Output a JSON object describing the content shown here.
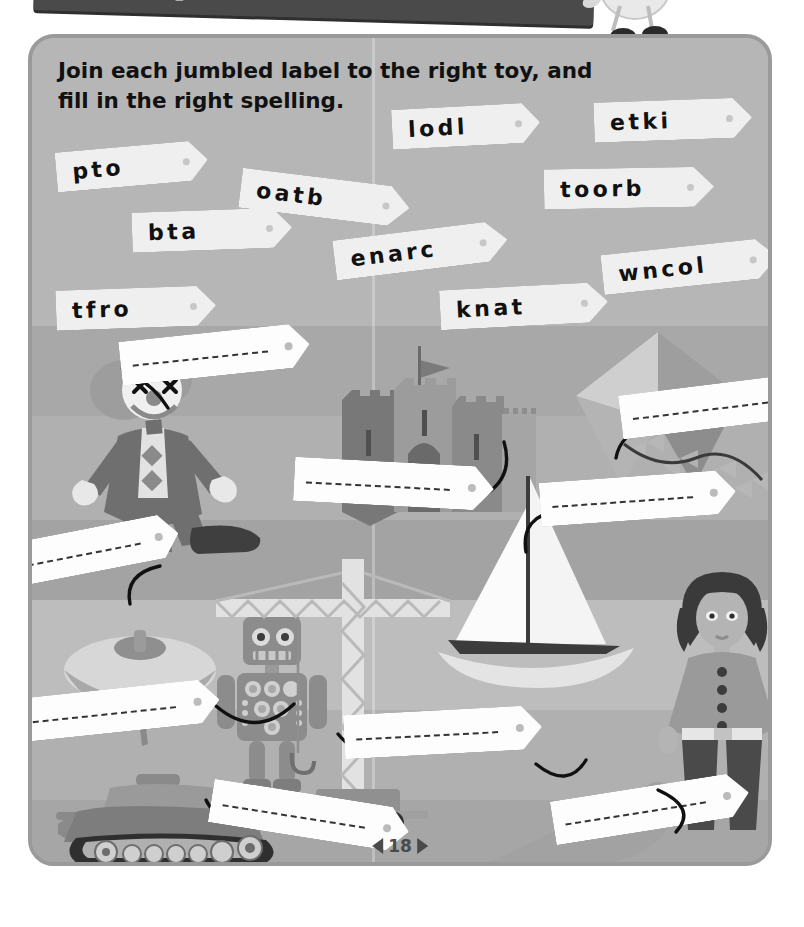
{
  "header": {
    "banner_text": "IN TH",
    "mascot_letter": "c"
  },
  "instruction": "Join each jumbled label to the right toy, and fill in the right spelling.",
  "jumbled_labels": [
    {
      "text": "pto",
      "answer": "top"
    },
    {
      "text": "oatb",
      "answer": "boat"
    },
    {
      "text": "lodl",
      "answer": "doll"
    },
    {
      "text": "etki",
      "answer": "kite"
    },
    {
      "text": "bta",
      "answer": "bat"
    },
    {
      "text": "toorb",
      "answer": "robot"
    },
    {
      "text": "enarc",
      "answer": "crane"
    },
    {
      "text": "wncol",
      "answer": "clown"
    },
    {
      "text": "tfro",
      "answer": "fort"
    },
    {
      "text": "knat",
      "answer": "tank"
    }
  ],
  "toys": [
    {
      "name": "clown"
    },
    {
      "name": "fort"
    },
    {
      "name": "kite"
    },
    {
      "name": "top"
    },
    {
      "name": "robot"
    },
    {
      "name": "crane"
    },
    {
      "name": "boat"
    },
    {
      "name": "doll"
    },
    {
      "name": "tank"
    },
    {
      "name": "bat"
    }
  ],
  "answer_tags": [
    {
      "id": "clown-tag"
    },
    {
      "id": "fort-tag"
    },
    {
      "id": "kite-tag"
    },
    {
      "id": "top-tag"
    },
    {
      "id": "boat-tag"
    },
    {
      "id": "robot-tag"
    },
    {
      "id": "tank-tag"
    },
    {
      "id": "bat-tag"
    },
    {
      "id": "crane-tag"
    },
    {
      "id": "doll-tag"
    }
  ],
  "footer": {
    "page_number": "18",
    "prev_marker": "◀",
    "next_marker": "▶"
  },
  "colors": {
    "page_bg": "#b6b6b6",
    "frame_border": "#9a9a9a",
    "tag_bg": "#efefef",
    "answer_tag_bg": "#fdfdfd",
    "ink": "#111111",
    "string": "#111111"
  }
}
